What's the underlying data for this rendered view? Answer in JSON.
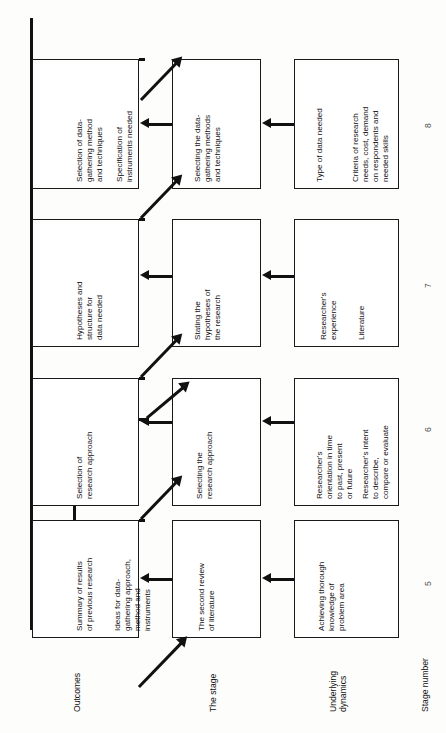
{
  "diagram": {
    "orientation": "rotated-90-ccw",
    "row_labels": {
      "outcomes": "Outcomes",
      "the_stage": "The stage",
      "underlying_dynamics": "Underlying\ndynamics",
      "stage_number": "Stage number"
    },
    "stage_numbers": [
      "5",
      "6",
      "7",
      "8"
    ],
    "columns": [
      {
        "stage_number": "5",
        "outcomes": [
          "Summary of results\nof previous research",
          "Ideas for data-\ngathering approach,\nmethod and\ninstruments"
        ],
        "stage": [
          "The second review\nof literature"
        ],
        "dynamics": [
          "Achieving thorough\nknowledge of\nproblem area"
        ]
      },
      {
        "stage_number": "6",
        "outcomes": [
          "Selection of\nresearch approach"
        ],
        "stage": [
          "Selecting the\nresearch approach"
        ],
        "dynamics": [
          "Researcher's\norientation in time\nto past, present\nor future",
          "Researcher's intent\nto describe,\ncompare or evaluate"
        ]
      },
      {
        "stage_number": "7",
        "outcomes": [
          "Hypotheses and\nstructure for\ndata needed"
        ],
        "stage": [
          "Stating the\nhypotheses of\nthe research"
        ],
        "dynamics": [
          "Researcher's\nexperience",
          "Literature"
        ]
      },
      {
        "stage_number": "8",
        "outcomes": [
          "Selection of data-\ngathering method\nand techniques",
          "Specification of\ninstruments needed"
        ],
        "stage": [
          "Selecting the data-\ngathering methods\nand techniques"
        ],
        "dynamics": [
          "Type of data needed",
          "Criteria of research\nneeds, cost, demand\non respondents and\nneeded skills"
        ]
      }
    ]
  },
  "colors": {
    "ink": "#111111",
    "paper": "#fdfdfb",
    "box_fill": "#ffffff"
  }
}
